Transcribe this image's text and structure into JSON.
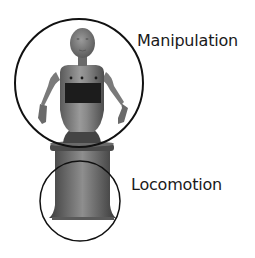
{
  "diagram": {
    "regions": [
      {
        "label": "Manipulation",
        "covers": "upper body (head, torso, arms)",
        "circle": {
          "cx": 79,
          "cy": 83,
          "r": 64
        }
      },
      {
        "label": "Locomotion",
        "covers": "mobile base",
        "circle": {
          "cx": 80,
          "cy": 201,
          "r": 40
        }
      }
    ],
    "colors": {
      "background": "#ffffff",
      "outline": "#111111",
      "robot_light": "#8c8c8c",
      "robot_mid": "#6e6e6e",
      "robot_dark": "#4a4a4a",
      "screen": "#1c1c1c",
      "text": "#1a1a1a"
    }
  }
}
